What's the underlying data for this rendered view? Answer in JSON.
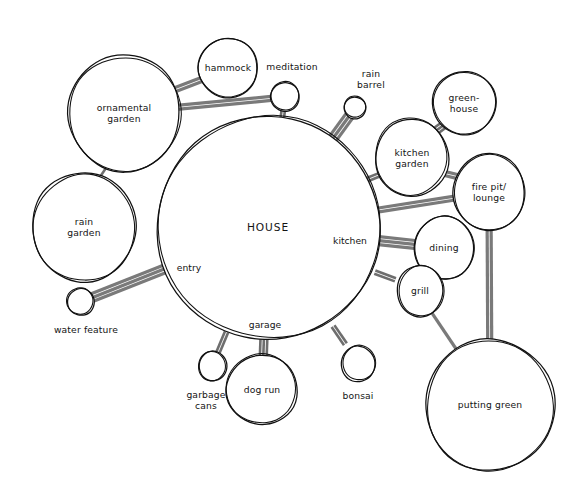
{
  "diagram": {
    "type": "bubble-diagram",
    "style": "hand-drawn",
    "canvas": {
      "width": 581,
      "height": 497
    },
    "colors": {
      "background": "#ffffff",
      "outline": "#111111",
      "connector": "#7a7a7a",
      "label": "#141414"
    },
    "caption": "",
    "center": {
      "id": "house",
      "label": "HOUSE",
      "cx": 268,
      "cy": 228,
      "rx": 112,
      "ry": 112
    },
    "house_zones": [
      {
        "id": "entry",
        "label": "entry",
        "x": 189,
        "y": 268
      },
      {
        "id": "garage",
        "label": "garage",
        "x": 265,
        "y": 325
      },
      {
        "id": "kitchen",
        "label": "kitchen",
        "x": 350,
        "y": 241
      }
    ],
    "nodes": [
      {
        "id": "ornamental-garden",
        "label": "ornamental\ngarden",
        "cx": 124,
        "cy": 113,
        "rx": 56,
        "ry": 59,
        "size": "large"
      },
      {
        "id": "hammock",
        "label": "hammock",
        "cx": 228,
        "cy": 68,
        "rx": 30,
        "ry": 30,
        "size": "medium"
      },
      {
        "id": "meditation",
        "label": "meditation",
        "cx": 285,
        "cy": 97,
        "rx": 14.5,
        "ry": 14.5,
        "size": "small",
        "label_dx": 7,
        "label_dy": -30
      },
      {
        "id": "rain-barrel",
        "label": "rain\nbarrel",
        "cx": 355,
        "cy": 108,
        "rx": 11,
        "ry": 11,
        "size": "tiny",
        "label_dx": 16,
        "label_dy": -29
      },
      {
        "id": "greenhouse",
        "label": "green-\nhouse",
        "cx": 464,
        "cy": 103,
        "rx": 32,
        "ry": 32,
        "size": "medium"
      },
      {
        "id": "kitchen-garden",
        "label": "kitchen\ngarden",
        "cx": 412,
        "cy": 158,
        "rx": 37,
        "ry": 39,
        "size": "medium"
      },
      {
        "id": "fire-pit-lounge",
        "label": "fire pit/\nlounge",
        "cx": 489,
        "cy": 192,
        "rx": 36,
        "ry": 39,
        "size": "medium"
      },
      {
        "id": "dining",
        "label": "dining",
        "cx": 444,
        "cy": 248,
        "rx": 30,
        "ry": 32,
        "size": "medium"
      },
      {
        "id": "grill",
        "label": "grill",
        "cx": 420,
        "cy": 291,
        "rx": 23,
        "ry": 26,
        "size": "small"
      },
      {
        "id": "putting-green",
        "label": "putting green",
        "cx": 490,
        "cy": 405,
        "rx": 65,
        "ry": 66,
        "size": "large"
      },
      {
        "id": "bonsai",
        "label": "bonsai",
        "cx": 358,
        "cy": 364,
        "rx": 17,
        "ry": 18,
        "size": "small",
        "label_dx": 0,
        "label_dy": 32
      },
      {
        "id": "dog-run",
        "label": "dog run",
        "cx": 262,
        "cy": 390,
        "rx": 36,
        "ry": 35,
        "size": "medium"
      },
      {
        "id": "garbage-cans",
        "label": "garbage\ncans",
        "cx": 213,
        "cy": 366,
        "rx": 14,
        "ry": 15,
        "size": "small",
        "label_dx": -7,
        "label_dy": 34
      },
      {
        "id": "water-feature",
        "label": "water feature",
        "cx": 81,
        "cy": 302,
        "rx": 13.5,
        "ry": 13.5,
        "size": "small",
        "label_dx": 5,
        "label_dy": 28
      },
      {
        "id": "rain-garden",
        "label": "rain\ngarden",
        "cx": 84,
        "cy": 227,
        "rx": 52,
        "ry": 55,
        "size": "large"
      }
    ],
    "connections": [
      {
        "from": "ornamental-garden",
        "to": "hammock",
        "strands": 2,
        "weight": "heavy"
      },
      {
        "from": "ornamental-garden",
        "to": "meditation",
        "strands": 2,
        "weight": "heavy"
      },
      {
        "from": "ornamental-garden",
        "to": "rain-garden",
        "strands": 1,
        "weight": "tick"
      },
      {
        "from": "meditation",
        "to": "house",
        "strands": 2,
        "weight": "tick"
      },
      {
        "from": "rain-barrel",
        "to": "house",
        "strands": 3,
        "weight": "heavy"
      },
      {
        "from": "kitchen-garden",
        "to": "greenhouse",
        "strands": 3,
        "weight": "tick"
      },
      {
        "from": "kitchen-garden",
        "to": "house",
        "strands": 2,
        "weight": "tick"
      },
      {
        "from": "kitchen-garden",
        "to": "fire-pit-lounge",
        "strands": 2,
        "weight": "heavy"
      },
      {
        "from": "house",
        "to": "fire-pit-lounge",
        "strands": 2,
        "weight": "heavy"
      },
      {
        "from": "house",
        "to": "dining",
        "strands": 3,
        "weight": "heavy"
      },
      {
        "from": "dining",
        "to": "grill",
        "strands": 2,
        "weight": "tick"
      },
      {
        "from": "house",
        "to": "grill",
        "strands": 2,
        "weight": "tick"
      },
      {
        "from": "fire-pit-lounge",
        "to": "putting-green",
        "strands": 2,
        "weight": "heavy"
      },
      {
        "from": "grill",
        "to": "putting-green",
        "strands": 1,
        "weight": "heavy"
      },
      {
        "from": "house",
        "to": "bonsai",
        "strands": 2,
        "weight": "tick"
      },
      {
        "from": "house",
        "to": "dog-run",
        "strands": 3,
        "weight": "tick"
      },
      {
        "from": "house",
        "to": "garbage-cans",
        "strands": 2,
        "weight": "tick"
      },
      {
        "from": "water-feature",
        "to": "house",
        "strands": 3,
        "weight": "heavy"
      }
    ]
  }
}
